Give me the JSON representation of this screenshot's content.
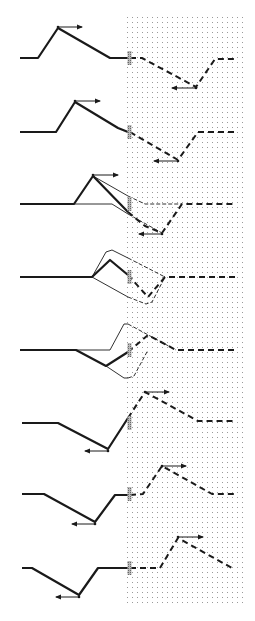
{
  "diagram": {
    "colors": {
      "ink": "#1a1a1a",
      "dot": "#9a9a9a",
      "wall": "#8c8c8c"
    },
    "medium_region": {
      "x": 125,
      "y": 15,
      "width": 120,
      "height": 590,
      "dot_spacing": 5
    },
    "wall_x": 129,
    "panels": [
      {
        "id": 1,
        "baseline_y": 58,
        "incident": [
          [
            20,
            58
          ],
          [
            38,
            58
          ],
          [
            58,
            28
          ],
          [
            110,
            58
          ],
          [
            128,
            58
          ]
        ],
        "reflected_dashed": [
          [
            130,
            58
          ],
          [
            142,
            58
          ],
          [
            196,
            87
          ],
          [
            215,
            59
          ],
          [
            235,
            59
          ]
        ],
        "arrows": [
          {
            "from": [
              58,
              27
            ],
            "to": [
              82,
              27
            ]
          },
          {
            "from": [
              196,
              88
            ],
            "to": [
              172,
              88
            ]
          }
        ]
      },
      {
        "id": 2,
        "baseline_y": 132,
        "incident": [
          [
            20,
            132
          ],
          [
            56,
            132
          ],
          [
            75,
            102
          ],
          [
            118,
            128
          ],
          [
            128,
            132
          ]
        ],
        "reflected_dashed": [
          [
            130,
            132
          ],
          [
            178,
            160
          ],
          [
            198,
            132
          ],
          [
            235,
            132
          ]
        ],
        "arrows": [
          {
            "from": [
              75,
              101
            ],
            "to": [
              100,
              101
            ]
          },
          {
            "from": [
              178,
              161
            ],
            "to": [
              154,
              161
            ]
          }
        ]
      },
      {
        "id": 3,
        "baseline_y": 204,
        "incident": [
          [
            20,
            204
          ],
          [
            74,
            204
          ],
          [
            93,
            176
          ],
          [
            128,
            212
          ]
        ],
        "combined_dashed": [
          [
            128,
            212
          ],
          [
            145,
            226
          ],
          [
            162,
            233
          ],
          [
            182,
            204
          ],
          [
            235,
            204
          ]
        ],
        "thin_incident_solid": [
          [
            93,
            176
          ],
          [
            128,
            196
          ]
        ],
        "thin_incident_dashed": [
          [
            128,
            196
          ],
          [
            145,
            204
          ],
          [
            182,
            204
          ]
        ],
        "thin_inverted_solid": [
          [
            74,
            204
          ],
          [
            112,
            204
          ],
          [
            128,
            214
          ]
        ],
        "thin_inverted_dashed": [
          [
            128,
            214
          ],
          [
            162,
            233
          ]
        ],
        "arrows": [
          {
            "from": [
              93,
              175
            ],
            "to": [
              118,
              175
            ]
          },
          {
            "from": [
              162,
              234
            ],
            "to": [
              139,
              234
            ]
          }
        ]
      },
      {
        "id": 4,
        "baseline_y": 277,
        "incident": [
          [
            20,
            277
          ],
          [
            92,
            277
          ],
          [
            110,
            260
          ],
          [
            128,
            275
          ]
        ],
        "combined_dashed": [
          [
            128,
            275
          ],
          [
            148,
            297
          ],
          [
            165,
            277
          ],
          [
            235,
            277
          ]
        ],
        "thin_upper_solid": [
          [
            92,
            277
          ],
          [
            106,
            252
          ],
          [
            112,
            250
          ],
          [
            128,
            258
          ]
        ],
        "thin_upper_dashed": [
          [
            128,
            258
          ],
          [
            165,
            277
          ]
        ],
        "thin_lower_solid": [
          [
            92,
            277
          ],
          [
            128,
            297
          ]
        ],
        "thin_lower_dashed": [
          [
            128,
            297
          ],
          [
            146,
            304
          ],
          [
            152,
            302
          ],
          [
            165,
            277
          ]
        ],
        "arrows": []
      },
      {
        "id": 5,
        "baseline_y": 350,
        "incident": [
          [
            20,
            350
          ],
          [
            76,
            350
          ],
          [
            106,
            366
          ],
          [
            128,
            352
          ]
        ],
        "combined_dashed": [
          [
            128,
            352
          ],
          [
            148,
            335
          ],
          [
            176,
            350
          ],
          [
            235,
            350
          ]
        ],
        "thin_upper_solid": [
          [
            76,
            350
          ],
          [
            110,
            350
          ],
          [
            124,
            324
          ],
          [
            128,
            324
          ]
        ],
        "thin_upper_dashed": [
          [
            128,
            324
          ],
          [
            176,
            350
          ]
        ],
        "thin_lower_solid": [
          [
            106,
            366
          ],
          [
            124,
            378
          ],
          [
            128,
            378
          ]
        ],
        "thin_lower_dashed": [
          [
            128,
            378
          ],
          [
            134,
            376
          ],
          [
            148,
            350
          ]
        ],
        "arrows": []
      },
      {
        "id": 6,
        "baseline_y": 423,
        "incident": [
          [
            22,
            423
          ],
          [
            58,
            423
          ],
          [
            108,
            449
          ],
          [
            128,
            418
          ]
        ],
        "reflected_dashed": [
          [
            128,
            418
          ],
          [
            145,
            392
          ],
          [
            198,
            421
          ],
          [
            235,
            421
          ]
        ],
        "arrows": [
          {
            "from": [
              108,
              451
            ],
            "to": [
              85,
              451
            ]
          },
          {
            "from": [
              145,
              392
            ],
            "to": [
              169,
              392
            ]
          }
        ]
      },
      {
        "id": 7,
        "baseline_y": 494,
        "incident": [
          [
            22,
            494
          ],
          [
            44,
            494
          ],
          [
            95,
            522
          ],
          [
            115,
            495
          ],
          [
            128,
            495
          ]
        ],
        "reflected_dashed": [
          [
            130,
            495
          ],
          [
            143,
            494
          ],
          [
            162,
            466
          ],
          [
            212,
            494
          ],
          [
            235,
            494
          ]
        ],
        "arrows": [
          {
            "from": [
              95,
              524
            ],
            "to": [
              72,
              524
            ]
          },
          {
            "from": [
              162,
              466
            ],
            "to": [
              186,
              466
            ]
          }
        ]
      },
      {
        "id": 8,
        "baseline_y": 568,
        "incident": [
          [
            22,
            568
          ],
          [
            32,
            568
          ],
          [
            79,
            595
          ],
          [
            98,
            568
          ],
          [
            128,
            568
          ]
        ],
        "reflected_dashed": [
          [
            130,
            568
          ],
          [
            160,
            568
          ],
          [
            178,
            538
          ],
          [
            232,
            568
          ]
        ],
        "arrows": [
          {
            "from": [
              79,
              597
            ],
            "to": [
              56,
              597
            ]
          },
          {
            "from": [
              178,
              537
            ],
            "to": [
              203,
              537
            ]
          }
        ]
      }
    ]
  }
}
